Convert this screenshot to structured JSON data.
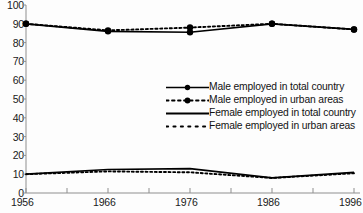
{
  "chart_data": {
    "type": "line",
    "title": "",
    "xlabel": "",
    "ylabel": "",
    "x": [
      1956,
      1966,
      1976,
      1986,
      1996
    ],
    "xlim": [
      1956,
      1996
    ],
    "ylim": [
      0,
      100
    ],
    "grid": false,
    "legend_position": "center-right",
    "xticklabels": [
      "1956",
      "1966",
      "1976",
      "1986",
      "1996"
    ],
    "yticklabels": [
      "0",
      "10",
      "20",
      "30",
      "40",
      "50",
      "60",
      "70",
      "80",
      "90",
      "100"
    ],
    "ytick_values": [
      0,
      10,
      20,
      30,
      40,
      50,
      60,
      70,
      80,
      90,
      100
    ],
    "ytick_step": 10,
    "xtick_step": 5,
    "series": [
      {
        "name": "Male employed in total country",
        "style": "solid",
        "marker": "circle",
        "color": "#000000",
        "values": [
          90,
          86,
          85.5,
          90,
          87
        ]
      },
      {
        "name": "Male employed in urban areas",
        "style": "dashed",
        "marker": "circle",
        "color": "#000000",
        "values": [
          90,
          86.5,
          88,
          90,
          87
        ]
      },
      {
        "name": "Female employed in total country",
        "style": "solid",
        "marker": "none",
        "color": "#000000",
        "values": [
          10,
          12.5,
          13,
          8,
          11
        ]
      },
      {
        "name": "Female employed in urban areas",
        "style": "dotted",
        "marker": "none",
        "color": "#000000",
        "values": [
          10,
          11.5,
          11,
          8,
          10.5
        ]
      }
    ]
  },
  "legend": {
    "items": [
      {
        "label": "Male employed in total country",
        "sample": "solid-line-with-marker"
      },
      {
        "label": "Male employed in urban areas",
        "sample": "dashed-line-with-marker"
      },
      {
        "label": "Female employed in total country",
        "sample": "solid-line"
      },
      {
        "label": "Female employed in urban areas",
        "sample": "dotted-line"
      }
    ]
  },
  "axes": {
    "axis_color": "#8a8a8a",
    "line_color": "#000000",
    "text_color": "#1a1a1a"
  }
}
